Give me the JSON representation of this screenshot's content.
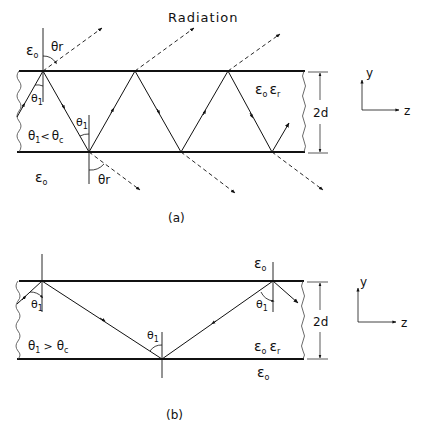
{
  "figure_a": {
    "caption": "(a)",
    "radiation_label": "Radiation",
    "eps0_top": "ε",
    "eps0_top_sub": "o",
    "eps0_bottom": "ε",
    "eps0_bottom_sub": "o",
    "eps_r_label": "ε",
    "eps_r_label_sub1": "o",
    "eps_r_label2": "ε",
    "eps_r_label_sub2": "r",
    "theta_r_top": "θ",
    "theta_r_top_sub": "r",
    "theta_r_bottom": "θ",
    "theta_r_bottom_sub": "r",
    "theta_1_a": "θ",
    "theta_1_a_sub": "1",
    "theta_1_b": "θ",
    "theta_1_b_sub": "1",
    "condition": "θ",
    "condition_sub1": "1",
    "condition_op": "<",
    "condition_rhs": "θ",
    "condition_sub2": "c",
    "thickness": "2d"
  },
  "figure_b": {
    "caption": "(b)",
    "eps0_top": "ε",
    "eps0_top_sub": "o",
    "eps0_bottom": "ε",
    "eps0_bottom_sub": "o",
    "eps_r_label": "ε",
    "eps_r_label_sub1": "o",
    "eps_r_label2": "ε",
    "eps_r_label_sub2": "r",
    "theta_1_left": "θ",
    "theta_1_left_sub": "1",
    "theta_1_mid": "θ",
    "theta_1_mid_sub": "1",
    "theta_1_right": "θ",
    "theta_1_right_sub": "1",
    "condition": "θ",
    "condition_sub1": "1",
    "condition_op": ">",
    "condition_rhs": "θ",
    "condition_sub2": "c",
    "thickness": "2d"
  },
  "axes": {
    "y_label": "y",
    "z_label": "z"
  }
}
